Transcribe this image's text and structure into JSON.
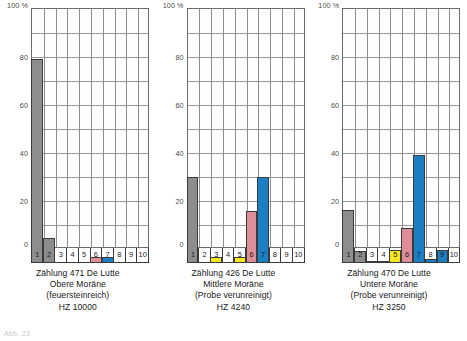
{
  "figure": {
    "footnote": "Abb. 23",
    "y_axis": {
      "top_label": "100 %",
      "ticks": [
        "80",
        "60",
        "40",
        "20",
        "0"
      ],
      "ylim": [
        0,
        100
      ],
      "gridline_step": 10
    },
    "x_categories": [
      "1",
      "2",
      "3",
      "4",
      "5",
      "6",
      "7",
      "8",
      "9",
      "10"
    ],
    "colors": {
      "gray": "#8d8d8d",
      "yellow": "#f5e620",
      "pink": "#de8e96",
      "blue": "#1a7fc4",
      "grid": "#9a9a9a",
      "frame": "#3a3a3a"
    }
  },
  "chart_data": [
    {
      "type": "bar",
      "title": "Zählung 471 De Lutte",
      "caption_lines": [
        "Zählung 471 De Lutte",
        "Obere Moräne",
        "(feuersteinreich)",
        "HZ 10000"
      ],
      "xlabel": "",
      "ylabel": "100 %",
      "ylim": [
        0,
        100
      ],
      "categories": [
        "1",
        "2",
        "3",
        "4",
        "5",
        "6",
        "7",
        "8",
        "9",
        "10"
      ],
      "values": [
        85,
        10.5,
        0,
        0,
        0,
        2.5,
        2.5,
        0,
        0,
        0
      ],
      "bar_colors": [
        "gray",
        "gray",
        "gray",
        "gray",
        "gray",
        "pink",
        "blue",
        "blue",
        "blue",
        "blue"
      ]
    },
    {
      "type": "bar",
      "title": "Zählung 426 De Lutte",
      "caption_lines": [
        "Zählung 426 De Lutte",
        "Mittlere Moräne",
        "(Probe verunreinigt)",
        "HZ 4240"
      ],
      "xlabel": "",
      "ylabel": "100 %",
      "ylim": [
        0,
        100
      ],
      "categories": [
        "1",
        "2",
        "3",
        "4",
        "5",
        "6",
        "7",
        "8",
        "9",
        "10"
      ],
      "values": [
        36,
        0,
        2.5,
        0,
        2.5,
        21.5,
        36,
        0,
        0,
        0
      ],
      "bar_colors": [
        "gray",
        "gray",
        "yellow",
        "gray",
        "yellow",
        "pink",
        "blue",
        "blue",
        "blue",
        "blue"
      ]
    },
    {
      "type": "bar",
      "title": "Zählung 470 De Lutte",
      "caption_lines": [
        "Zählung 470 De Lutte",
        "Untere Moräne",
        "(Probe verunreinigt)",
        "HZ 3250"
      ],
      "xlabel": "",
      "ylabel": "100 %",
      "ylim": [
        0,
        100
      ],
      "categories": [
        "1",
        "2",
        "3",
        "4",
        "5",
        "6",
        "7",
        "8",
        "9",
        "10"
      ],
      "values": [
        22,
        5,
        1,
        1,
        5.5,
        14.5,
        45,
        1.5,
        5.5,
        0
      ],
      "bar_colors": [
        "gray",
        "gray",
        "yellow",
        "yellow",
        "yellow",
        "pink",
        "blue",
        "blue",
        "blue",
        "blue"
      ]
    }
  ]
}
